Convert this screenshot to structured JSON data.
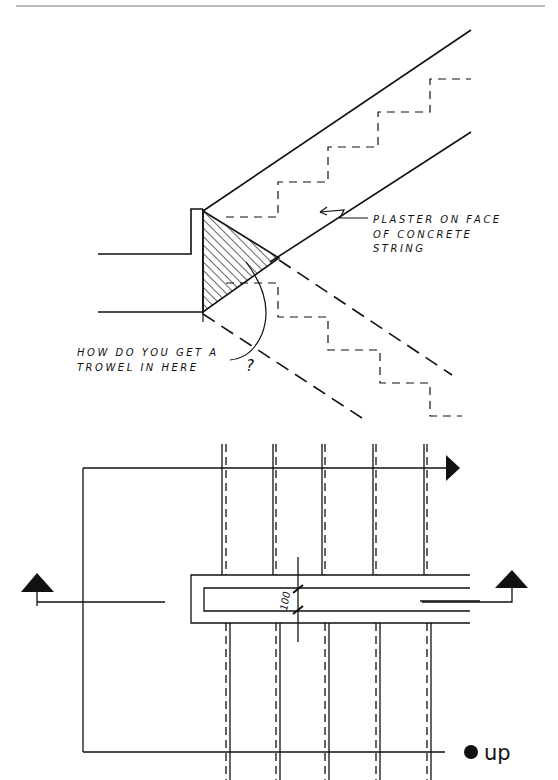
{
  "page": {
    "header_rule": true
  },
  "section_drawing": {
    "annotation_plaster": {
      "line1": "PLASTER ON FACE",
      "line2": "OF CONCRETE",
      "line3": "STRING"
    },
    "annotation_trowel": {
      "line1": "HOW DO YOU GET A",
      "line2": "TROWEL IN HERE",
      "mark": "?"
    },
    "hatch_label": "hatched-corner"
  },
  "plan_drawing": {
    "dimension_label": "100",
    "direction_label": "up",
    "section_markers": [
      "section-arrow-left",
      "section-arrow-right",
      "direction-arrow-right"
    ]
  },
  "colors": {
    "ink": "#111111",
    "paper": "#ffffff",
    "rule": "#777777"
  }
}
